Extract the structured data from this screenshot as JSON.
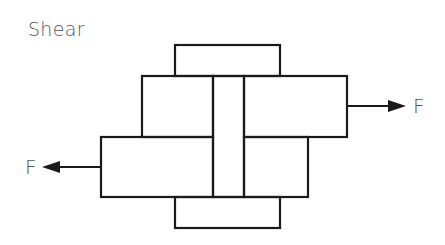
{
  "diagram": {
    "title": "Shear",
    "force_right_label": "F",
    "force_left_label": "F",
    "stroke_color": "#1a1a1a",
    "text_color": "#555555",
    "parts": [
      {
        "name": "top-cap",
        "x": 175,
        "y": 45,
        "w": 105,
        "h": 31
      },
      {
        "name": "upper-left-plate",
        "x": 142,
        "y": 76,
        "w": 71,
        "h": 61
      },
      {
        "name": "pin",
        "x": 213,
        "y": 76,
        "w": 31,
        "h": 121
      },
      {
        "name": "upper-right-plate",
        "x": 244,
        "y": 76,
        "w": 103,
        "h": 61
      },
      {
        "name": "lower-left-plate",
        "x": 101,
        "y": 137,
        "w": 112,
        "h": 60
      },
      {
        "name": "lower-right-plate",
        "x": 244,
        "y": 137,
        "w": 64,
        "h": 60
      },
      {
        "name": "bottom-cap",
        "x": 175,
        "y": 197,
        "w": 105,
        "h": 31
      }
    ]
  }
}
